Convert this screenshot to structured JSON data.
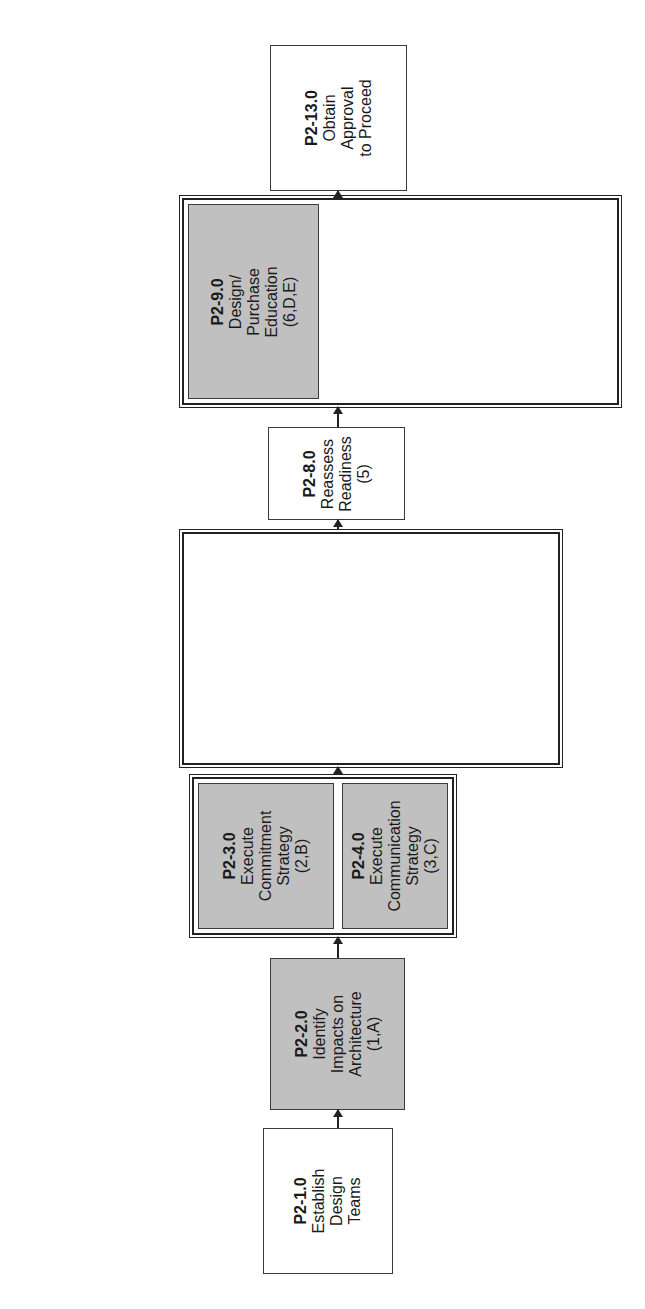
{
  "diagram": {
    "orientation": "rotated 90deg counter-clockwise; flow runs bottom to top",
    "colors": {
      "shaded_fill": "#c9c9c9",
      "plain_fill": "#ffffff",
      "stroke": "#222222"
    },
    "nodes": {
      "n1": {
        "id": "P2-1.0",
        "lines": [
          "Establish",
          "Design",
          "Teams"
        ],
        "shaded": false
      },
      "n2": {
        "id": "P2-2.0",
        "lines": [
          "Identify",
          "Impacts on",
          "Architecture",
          "(1,A)"
        ],
        "shaded": true
      },
      "n3": {
        "id": "P2-3.0",
        "lines": [
          "Execute",
          "Commitment",
          "Strategy",
          "(2,B)"
        ],
        "shaded": true
      },
      "n4": {
        "id": "P2-4.0",
        "lines": [
          "Execute",
          "Communication",
          "Strategy",
          "(3,C)"
        ],
        "shaded": true
      },
      "n5": {
        "id": "P2-5.0",
        "lines": [
          "Design",
          "Technology",
          "Changes",
          "(4)"
        ],
        "shaded": true
      },
      "n6": {
        "id": "P2-6.0",
        "lines": [
          "Design",
          "Organization",
          "Changes",
          "(4,F)"
        ],
        "shaded": true
      },
      "n7": {
        "id": "P2-7.0",
        "lines": [
          "Design Process",
          "Changes",
          "(4,G)"
        ],
        "shaded": true
      },
      "n8": {
        "id": "P2-8.0",
        "lines": [
          "Reassess",
          "Readiness",
          "(5)"
        ],
        "shaded": false
      },
      "n9": {
        "id": "P2-9.0",
        "lines": [
          "Design/",
          "Purchase",
          "Education",
          "(6,D,E)"
        ],
        "shaded": true
      },
      "n10": {
        "id": "P2-10.0",
        "lines": [
          "Develop",
          "Culture",
          "Transition Plan",
          "(7,H)"
        ],
        "shaded": true
      },
      "n11": {
        "id": "P2-11.0",
        "lines": [
          "Develop",
          "Evaluation",
          "Strategy",
          "(I)"
        ],
        "shaded": false
      },
      "n12": {
        "id": "P2-12.0",
        "lines": [
          "Develop",
          "Implementation",
          "Plan",
          "(8,9,J)"
        ],
        "shaded": true
      },
      "n13": {
        "id": "P2-13.0",
        "lines": [
          "Obtain",
          "Approval",
          "to Proceed"
        ],
        "shaded": false
      }
    },
    "groups": [
      {
        "name": "group-commitment-communication",
        "members": [
          "P2-3.0",
          "P2-4.0"
        ]
      },
      {
        "name": "group-design-changes",
        "members": [
          "P2-5.0",
          "P2-6.0",
          "P2-7.0"
        ]
      },
      {
        "name": "group-plans",
        "members": [
          "P2-9.0",
          "P2-10.0",
          "P2-11.0",
          "P2-12.0"
        ]
      }
    ],
    "edges": [
      [
        "P2-1.0",
        "P2-2.0"
      ],
      [
        "P2-2.0",
        "group-commitment-communication"
      ],
      [
        "group-commitment-communication",
        "group-design-changes"
      ],
      [
        "group-design-changes",
        "P2-8.0"
      ],
      [
        "P2-8.0",
        "group-plans"
      ],
      [
        "group-plans",
        "P2-13.0"
      ]
    ]
  }
}
